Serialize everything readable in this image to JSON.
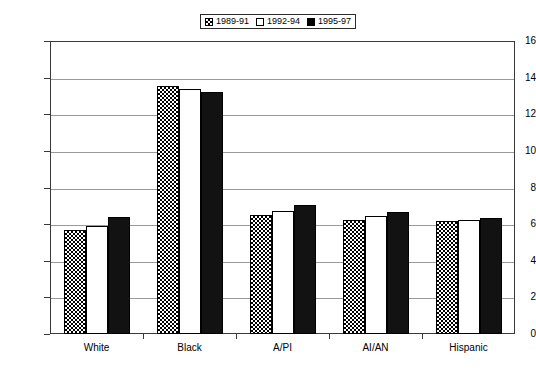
{
  "chart_data": {
    "type": "bar",
    "title": "",
    "xlabel": "",
    "ylabel": "",
    "ylim": [
      0,
      16
    ],
    "ytick_step": 2,
    "yticks": [
      "0",
      "2",
      "4",
      "6",
      "8",
      "10",
      "12",
      "14",
      "16"
    ],
    "grid": true,
    "legend_position": "top-center",
    "categories": [
      "White",
      "Black",
      "A/PI",
      "AI/AN",
      "Hispanic"
    ],
    "series": [
      {
        "name": "1989-91",
        "pattern": "checkered",
        "values": [
          5.7,
          13.55,
          6.5,
          6.2,
          6.15
        ]
      },
      {
        "name": "1992-94",
        "pattern": "white",
        "values": [
          5.9,
          13.4,
          6.7,
          6.45,
          6.2
        ]
      },
      {
        "name": "1995-97",
        "pattern": "black",
        "values": [
          6.4,
          13.2,
          7.05,
          6.65,
          6.35
        ]
      }
    ]
  },
  "colors": {
    "bar_black": "#121212",
    "bar_white": "#ffffff",
    "outline": "#000000",
    "gridline": "#9a9a9a",
    "axis": "#3a3a3a",
    "background": "#ffffff"
  }
}
